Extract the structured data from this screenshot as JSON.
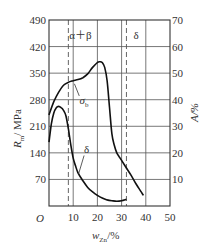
{
  "chart_data": {
    "type": "line",
    "title": "",
    "xlabel": "w_Zn/%",
    "xlabel_main": "w",
    "xlabel_sub": "Zn",
    "xlabel_unit": "/%",
    "ylabel_left": "R_m/MPa",
    "ylabel_left_main": "R",
    "ylabel_left_sub": "m",
    "ylabel_left_unit": "/ MPa",
    "ylabel_right": "A/%",
    "origin_label": "O",
    "xlim": [
      0,
      50
    ],
    "ylim_left": [
      0,
      490
    ],
    "ylim_right": [
      0,
      70
    ],
    "x_ticks": [
      "10",
      "20",
      "30",
      "40",
      "50"
    ],
    "x_tick_values": [
      10,
      20,
      30,
      40,
      50
    ],
    "y_left_ticks": [
      "70",
      "140",
      "210",
      "280",
      "350",
      "420",
      "490"
    ],
    "y_left_tick_values": [
      70,
      140,
      210,
      280,
      350,
      420,
      490
    ],
    "y_right_ticks": [
      "10",
      "20",
      "30",
      "40",
      "50",
      "60",
      "70"
    ],
    "y_right_tick_values": [
      10,
      20,
      30,
      40,
      50,
      60,
      70
    ],
    "grid": true,
    "phase_boundaries": [
      {
        "x": 8,
        "style": "dashed"
      },
      {
        "x": 32,
        "style": "dashed"
      }
    ],
    "region_labels": [
      {
        "text": "α＋β",
        "x": 13,
        "y": 450
      },
      {
        "text": "δ",
        "x": 36,
        "y": 450
      }
    ],
    "series": [
      {
        "name": "σb",
        "label": "σ",
        "label_sub": "b",
        "axis": "left",
        "x": [
          0,
          2,
          4,
          6,
          8,
          10,
          12,
          14,
          16,
          18,
          20,
          21,
          22,
          23,
          24,
          25,
          26,
          27,
          28,
          29,
          30,
          32,
          34,
          36,
          38,
          39
        ],
        "values": [
          240,
          275,
          300,
          318,
          326,
          330,
          333,
          338,
          348,
          365,
          378,
          380,
          378,
          365,
          330,
          260,
          190,
          160,
          140,
          130,
          120,
          100,
          80,
          58,
          38,
          28
        ]
      },
      {
        "name": "δ",
        "label": "δ",
        "axis": "right",
        "x": [
          0,
          1,
          2,
          3,
          4,
          5,
          6,
          7,
          8,
          9,
          10,
          11,
          12,
          14,
          16,
          18,
          20,
          22,
          24,
          26,
          28,
          30,
          32
        ],
        "values": [
          24,
          31,
          35,
          37,
          37.5,
          37,
          36,
          34,
          29,
          23,
          18,
          15,
          12.5,
          9.5,
          7,
          5.3,
          4,
          3,
          2.3,
          2,
          1.8,
          2,
          2.5
        ]
      }
    ]
  }
}
